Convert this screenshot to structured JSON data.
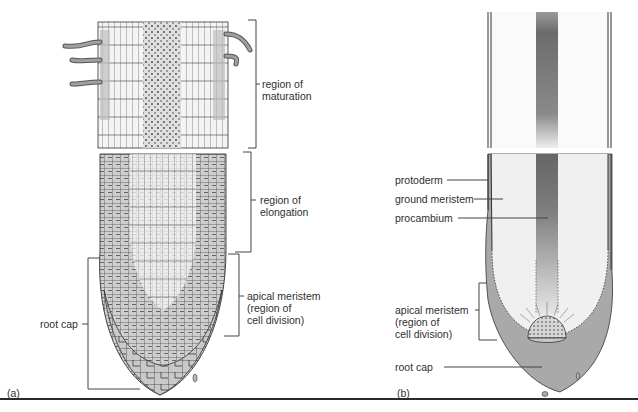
{
  "figure": {
    "panels": [
      {
        "id": "a",
        "tag": "(a)",
        "labels": {
          "maturation_line1": "region of",
          "maturation_line2": "maturation",
          "elongation_line1": "region of",
          "elongation_line2": "elongation",
          "meristem_line1": "apical meristem",
          "meristem_line2": "(region of",
          "meristem_line3": "cell division)",
          "root_cap": "root cap"
        }
      },
      {
        "id": "b",
        "tag": "(b)",
        "labels": {
          "protoderm": "protoderm",
          "ground_meristem": "ground meristem",
          "procambium": "procambium",
          "meristem_line1": "apical meristem",
          "meristem_line2": "(region of",
          "meristem_line3": "cell division)",
          "root_cap": "root cap"
        }
      }
    ],
    "colors": {
      "tissue_gray": "#a9a9a9",
      "procambium_dark": "#6e6e6e",
      "cell_fill": "#d0d0d0",
      "outline": "#333333",
      "pale_fill": "#f2f2f2"
    }
  }
}
